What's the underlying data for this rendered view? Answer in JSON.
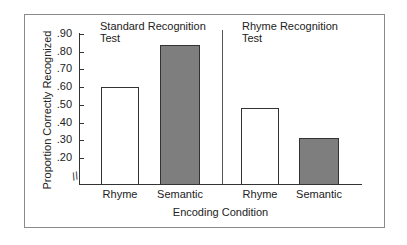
{
  "chart_data": {
    "type": "bar",
    "title": "",
    "xlabel": "Encoding Condition",
    "ylabel": "Proportion Correctly Recognized",
    "yticks": [
      ".90",
      ".80",
      ".70",
      ".60",
      ".50",
      ".40",
      ".30",
      ".20"
    ],
    "ylim": [
      0.1,
      0.9
    ],
    "axis_break": true,
    "panels": [
      {
        "title": "Standard Recognition Test",
        "categories": [
          "Rhyme",
          "Semantic"
        ],
        "values": [
          0.6,
          0.84
        ],
        "colors": [
          "#ffffff",
          "#7e7e7e"
        ]
      },
      {
        "title": "Rhyme Recognition Test",
        "categories": [
          "Rhyme",
          "Semantic"
        ],
        "values": [
          0.48,
          0.31
        ],
        "colors": [
          "#ffffff",
          "#7e7e7e"
        ]
      }
    ]
  },
  "labels": {
    "ylabel": "Proportion Correctly Recognized",
    "xlabel": "Encoding Condition",
    "panel1_line1": "Standard Recognition",
    "panel1_line2": "Test",
    "panel2_line1": "Rhyme Recognition",
    "panel2_line2": "Test",
    "cat_rhyme": "Rhyme",
    "cat_semantic": "Semantic",
    "axis_break_glyph": "//"
  }
}
